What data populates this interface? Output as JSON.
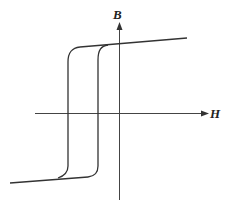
{
  "diagram": {
    "axes": {
      "x_label": "H",
      "y_label": "B"
    },
    "colors": {
      "line": "#333333",
      "axis": "#444444",
      "background": "#ffffff"
    }
  }
}
